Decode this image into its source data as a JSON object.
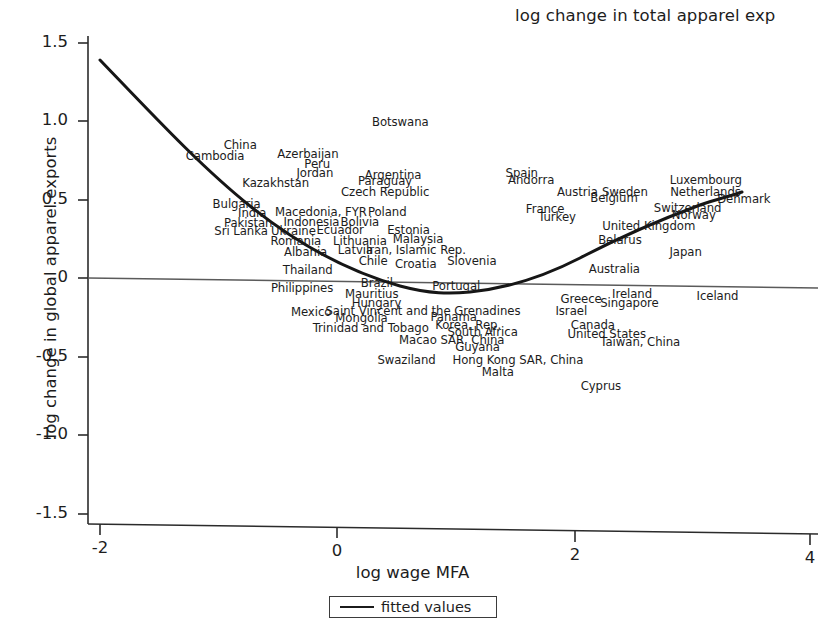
{
  "chart_data": {
    "type": "scatter",
    "title": "log change in total apparel exp",
    "xlabel": "log wage MFA",
    "ylabel": "log change in global apparel exports",
    "xlim": [
      -2.5,
      4.3
    ],
    "ylim": [
      -1.72,
      1.62
    ],
    "xticks": [
      -2,
      0,
      2,
      4
    ],
    "xtick_labels": [
      "-2",
      "0",
      "2",
      "4"
    ],
    "yticks": [
      1.5,
      1.0,
      0.5,
      0,
      -0.5,
      -1.0,
      -1.5
    ],
    "ytick_labels": [
      "1.5",
      "1.0",
      "0.5",
      "0",
      "-0.5",
      "-1.0",
      "-1.5"
    ],
    "grid": false,
    "legend_position": "below-axis",
    "legend": [
      {
        "label": "fitted values",
        "marker": "line",
        "color": "#1b1b1b"
      }
    ],
    "zero_reference_line": true,
    "fitted_curve": {
      "label": "fitted values",
      "color": "#1b1b1b",
      "points": [
        {
          "x": -2.0,
          "y": 1.39
        },
        {
          "x": -1.6,
          "y": 1.12
        },
        {
          "x": -1.2,
          "y": 0.87
        },
        {
          "x": -0.8,
          "y": 0.65
        },
        {
          "x": -0.4,
          "y": 0.45
        },
        {
          "x": 0.0,
          "y": 0.28
        },
        {
          "x": 0.4,
          "y": 0.14
        },
        {
          "x": 0.8,
          "y": 0.03
        },
        {
          "x": 1.1,
          "y": -0.03
        },
        {
          "x": 1.5,
          "y": -0.05
        },
        {
          "x": 1.9,
          "y": -0.02
        },
        {
          "x": 2.3,
          "y": 0.06
        },
        {
          "x": 2.7,
          "y": 0.18
        },
        {
          "x": 3.1,
          "y": 0.33
        },
        {
          "x": 3.4,
          "y": 0.47
        }
      ]
    },
    "point_label_note": "Each country name marks one data point; label text is positioned at the observation.",
    "points": [
      {
        "label": "China",
        "x": -0.82,
        "y": 0.845
      },
      {
        "label": "Cambodia",
        "x": -1.03,
        "y": 0.775
      },
      {
        "label": "Azerbaijan",
        "x": -0.25,
        "y": 0.785
      },
      {
        "label": "Peru",
        "x": -0.17,
        "y": 0.72
      },
      {
        "label": "Jordan",
        "x": -0.19,
        "y": 0.665
      },
      {
        "label": "Kazakhstan",
        "x": -0.52,
        "y": 0.605
      },
      {
        "label": "Botswana",
        "x": 0.53,
        "y": 0.99
      },
      {
        "label": "Argentina",
        "x": 0.47,
        "y": 0.655
      },
      {
        "label": "Paraguay",
        "x": 0.4,
        "y": 0.615
      },
      {
        "label": "Czech Republic",
        "x": 0.4,
        "y": 0.545
      },
      {
        "label": "Spain",
        "x": 1.55,
        "y": 0.665
      },
      {
        "label": "Andorra",
        "x": 1.63,
        "y": 0.62
      },
      {
        "label": "Luxembourg",
        "x": 3.1,
        "y": 0.62
      },
      {
        "label": "Austria",
        "x": 2.02,
        "y": 0.545
      },
      {
        "label": "Sweden",
        "x": 2.42,
        "y": 0.545
      },
      {
        "label": "Netherlands",
        "x": 3.1,
        "y": 0.545
      },
      {
        "label": "Bulgaria",
        "x": -0.85,
        "y": 0.465
      },
      {
        "label": "Belgium",
        "x": 2.33,
        "y": 0.505
      },
      {
        "label": "Denmark",
        "x": 3.42,
        "y": 0.5
      },
      {
        "label": "India",
        "x": -0.72,
        "y": 0.41
      },
      {
        "label": "Macedonia, FYR",
        "x": -0.14,
        "y": 0.415
      },
      {
        "label": "Poland",
        "x": 0.42,
        "y": 0.415
      },
      {
        "label": "France",
        "x": 1.75,
        "y": 0.435
      },
      {
        "label": "Switzerland",
        "x": 2.95,
        "y": 0.445
      },
      {
        "label": "Pakistan",
        "x": -0.75,
        "y": 0.345
      },
      {
        "label": "Indonesia",
        "x": -0.22,
        "y": 0.355
      },
      {
        "label": "Bolivia",
        "x": 0.19,
        "y": 0.355
      },
      {
        "label": "Turkey",
        "x": 1.85,
        "y": 0.385
      },
      {
        "label": "Norway",
        "x": 3.0,
        "y": 0.395
      },
      {
        "label": "Sri Lanka",
        "x": -0.81,
        "y": 0.295
      },
      {
        "label": "Ukraine",
        "x": -0.37,
        "y": 0.295
      },
      {
        "label": "Ecuador",
        "x": 0.02,
        "y": 0.3
      },
      {
        "label": "Estonia",
        "x": 0.6,
        "y": 0.305
      },
      {
        "label": "United Kingdom",
        "x": 2.62,
        "y": 0.325
      },
      {
        "label": "Romania",
        "x": -0.35,
        "y": 0.235
      },
      {
        "label": "Lithuania",
        "x": 0.19,
        "y": 0.235
      },
      {
        "label": "Malaysia",
        "x": 0.68,
        "y": 0.245
      },
      {
        "label": "Belarus",
        "x": 2.38,
        "y": 0.24
      },
      {
        "label": "Albania",
        "x": -0.27,
        "y": 0.165
      },
      {
        "label": "Latvia",
        "x": 0.15,
        "y": 0.175
      },
      {
        "label": "Iran, Islamic Rep.",
        "x": 0.66,
        "y": 0.175
      },
      {
        "label": "Japan",
        "x": 2.93,
        "y": 0.16
      },
      {
        "label": "Thailand",
        "x": -0.25,
        "y": 0.045
      },
      {
        "label": "Chile",
        "x": 0.3,
        "y": 0.105
      },
      {
        "label": "Croatia",
        "x": 0.66,
        "y": 0.085
      },
      {
        "label": "Slovenia",
        "x": 1.13,
        "y": 0.105
      },
      {
        "label": "Australia",
        "x": 2.33,
        "y": 0.055
      },
      {
        "label": "Philippines",
        "x": -0.3,
        "y": -0.07
      },
      {
        "label": "Brazil",
        "x": 0.33,
        "y": -0.035
      },
      {
        "label": "Portugal",
        "x": 1.0,
        "y": -0.055
      },
      {
        "label": "Ireland",
        "x": 2.48,
        "y": -0.105
      },
      {
        "label": "Iceland",
        "x": 3.2,
        "y": -0.115
      },
      {
        "label": "Mauritius",
        "x": 0.29,
        "y": -0.105
      },
      {
        "label": "Greece",
        "x": 2.05,
        "y": -0.135
      },
      {
        "label": "Hungary",
        "x": 0.33,
        "y": -0.165
      },
      {
        "label": "Singapore",
        "x": 2.46,
        "y": -0.165
      },
      {
        "label": "Mexico",
        "x": -0.22,
        "y": -0.22
      },
      {
        "label": "Saint Vincent and the Grenadines",
        "x": 0.72,
        "y": -0.215
      },
      {
        "label": "Israel",
        "x": 1.97,
        "y": -0.215
      },
      {
        "label": "Mongolia",
        "x": 0.2,
        "y": -0.255
      },
      {
        "label": "Panama",
        "x": 0.98,
        "y": -0.25
      },
      {
        "label": "Trinidad and Tobago",
        "x": 0.28,
        "y": -0.32
      },
      {
        "label": "Korea, Rep.",
        "x": 1.1,
        "y": -0.3
      },
      {
        "label": "Canada",
        "x": 2.15,
        "y": -0.305
      },
      {
        "label": "South Africa",
        "x": 1.22,
        "y": -0.345
      },
      {
        "label": "United States",
        "x": 2.27,
        "y": -0.36
      },
      {
        "label": "Macao SAR, China",
        "x": 0.96,
        "y": -0.395
      },
      {
        "label": "Taiwan, China",
        "x": 2.55,
        "y": -0.41
      },
      {
        "label": "Guyana",
        "x": 1.18,
        "y": -0.445
      },
      {
        "label": "Swaziland",
        "x": 0.58,
        "y": -0.525
      },
      {
        "label": "Hong Kong SAR, China",
        "x": 1.52,
        "y": -0.525
      },
      {
        "label": "Malta",
        "x": 1.35,
        "y": -0.6
      },
      {
        "label": "Cyprus",
        "x": 2.22,
        "y": -0.69
      }
    ]
  },
  "axes": {
    "y_title": "log change in global apparel exports",
    "x_title": "log wage MFA",
    "plot_title": "log change in total apparel exp"
  },
  "legend": {
    "fitted_label": "fitted values"
  }
}
